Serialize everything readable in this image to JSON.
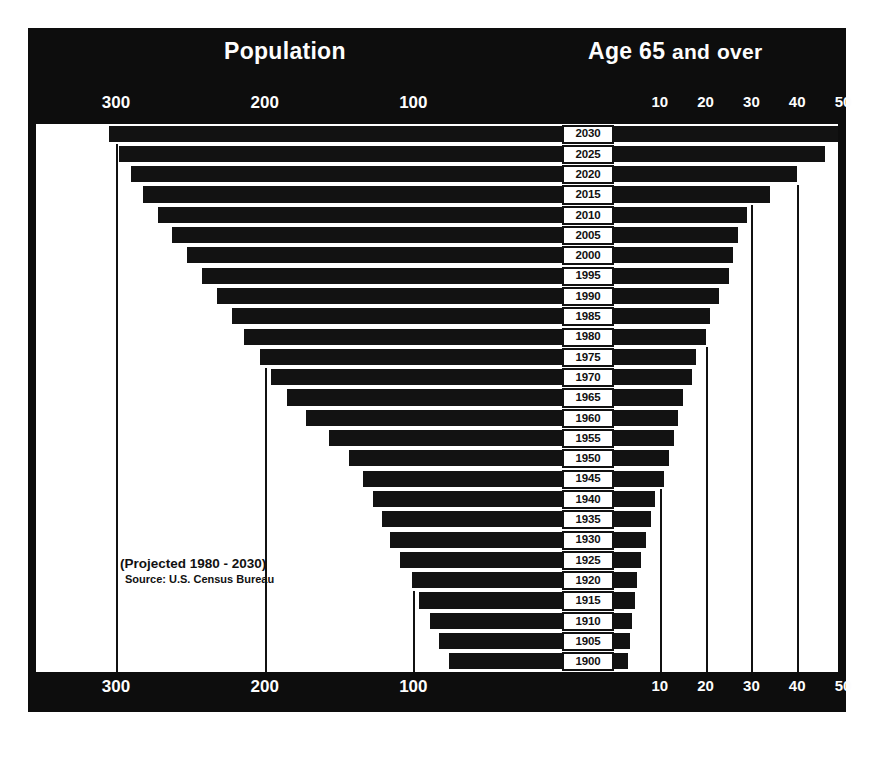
{
  "figure": {
    "title_left": "Population",
    "title_right_parts": [
      "Age",
      "65",
      "and",
      "over"
    ],
    "title_right": "Age 65 and over",
    "annotation_projected": "(Projected 1980 - 2030)",
    "annotation_source": "Source: U.S. Census Bureau",
    "colors": {
      "background": "#0d0d0d",
      "plot": "#ffffff",
      "bar": "#121212",
      "text_light": "#fdfdfd",
      "text_dark": "#111111"
    }
  },
  "axes": {
    "left_ticks": [
      300,
      200,
      100
    ],
    "left_tick_labels": [
      "300",
      "200",
      "100"
    ],
    "right_ticks": [
      10,
      20,
      30,
      40,
      50
    ],
    "right_tick_labels": [
      "10",
      "20",
      "30",
      "40",
      "50"
    ],
    "left_axis_title": "Population",
    "right_axis_title": "Age 65 and over",
    "left_units": "millions",
    "right_units": "millions",
    "left_max": 330,
    "right_max": 57,
    "top_axis": true,
    "bottom_axis": true
  },
  "chart_data": {
    "type": "bar",
    "subtitle": "(Projected 1980 - 2030)",
    "xlabel": "",
    "ylabel": "Year",
    "orientation": "horizontal",
    "style": "back-to-back pyramid (bi-directional bars)",
    "grid": true,
    "legend_position": "none",
    "annotations": [
      "(Projected 1980 - 2030)",
      "Source: U.S. Census Bureau"
    ],
    "categories": [
      "2030",
      "2025",
      "2020",
      "2015",
      "2010",
      "2005",
      "2000",
      "1995",
      "1990",
      "1985",
      "1980",
      "1975",
      "1970",
      "1965",
      "1960",
      "1955",
      "1950",
      "1945",
      "1940",
      "1935",
      "1930",
      "1925",
      "1920",
      "1915",
      "1910",
      "1905",
      "1900"
    ],
    "series": [
      {
        "name": "Population",
        "direction": "left",
        "unit": "millions",
        "xlim": [
          0,
          330
        ],
        "values": [
          305,
          298,
          290,
          282,
          272,
          262,
          252,
          242,
          232,
          222,
          214,
          203,
          196,
          185,
          172,
          157,
          143,
          134,
          127,
          121,
          116,
          109,
          101,
          96,
          89,
          83,
          76
        ]
      },
      {
        "name": "Age 65 and over",
        "direction": "right",
        "unit": "millions",
        "xlim": [
          0,
          57
        ],
        "values": [
          52,
          46,
          40,
          34,
          29,
          27,
          26,
          25,
          23,
          21,
          20,
          18,
          17,
          15,
          14,
          13,
          12,
          11,
          9,
          8,
          7,
          6,
          5,
          4.5,
          4,
          3.5,
          3
        ]
      }
    ]
  }
}
